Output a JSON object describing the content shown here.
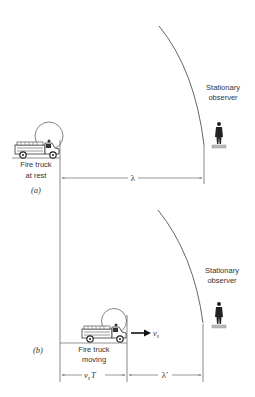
{
  "panel_a": {
    "caption": "(a)",
    "truck_label_line1": "Fire truck",
    "truck_label_line2": "at rest",
    "observer_label_line1": "Stationary",
    "observer_label_line2": "observer",
    "wavelength_label": "λ"
  },
  "panel_b": {
    "caption": "(b)",
    "truck_label_line1": "Fire truck",
    "truck_label_line2": "moving",
    "observer_label_line1": "Stationary",
    "observer_label_line2": "observer",
    "velocity_label": "v",
    "velocity_subscript": "s",
    "displacement_label_v": "v",
    "displacement_label_sub": "s",
    "displacement_label_T": "T",
    "wavelength_label": "λ′"
  },
  "colors": {
    "line": "#555555",
    "ink": "#222222",
    "ground": "#999999"
  }
}
